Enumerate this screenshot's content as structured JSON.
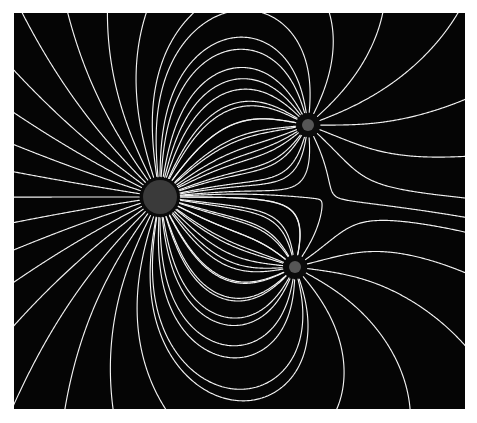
{
  "figure": {
    "canvas_width": 477,
    "canvas_height": 423,
    "background_color": "#ffffff"
  },
  "plot_area": {
    "x": 14,
    "y": 13,
    "width": 451,
    "height": 396,
    "background_color": "#050505",
    "border": "none"
  },
  "style": {
    "line_color": "#f2f2f2",
    "line_width": 1.15,
    "charge_ring_color": "#0b0b0b",
    "charge_core_color_large": "#3a3a3a",
    "charge_core_color_small": "#565656"
  },
  "chart_data": {
    "type": "scatter",
    "subtitle": "",
    "xlabel": "",
    "ylabel": "",
    "xlim": [
      14,
      465
    ],
    "ylim": [
      13,
      409
    ],
    "grid": false,
    "legend": "none",
    "annotations": [
      {
        "name": "saddle-point",
        "x": 322,
        "y": 200,
        "label": "null point between charges"
      }
    ],
    "charges": [
      {
        "name": "large-positive-charge",
        "label": "Q1",
        "x": 160,
        "y": 197,
        "strength": 3.0,
        "sign": "positive",
        "ring_radius": 20,
        "core_radius": 17,
        "core_color": "#3a3a3a",
        "ring_color": "#0b0b0b",
        "field_line_count": 40
      },
      {
        "name": "small-negative-charge-top-right",
        "label": "Q2",
        "x": 308,
        "y": 125,
        "strength": -1.0,
        "sign": "negative",
        "ring_radius": 12,
        "core_radius": 6,
        "core_color": "#565656",
        "ring_color": "#0b0b0b",
        "field_line_count": 24
      },
      {
        "name": "small-negative-charge-bottom",
        "label": "Q3",
        "x": 295,
        "y": 267,
        "strength": -1.0,
        "sign": "negative",
        "ring_radius": 12,
        "core_radius": 6,
        "core_color": "#565656",
        "ring_color": "#0b0b0b",
        "field_line_count": 24
      }
    ],
    "seeds": {
      "large_charge_line_count": 40,
      "top_right_extra_line_count": 17,
      "bottom_extra_line_count": 17,
      "integration_step": 1.1,
      "max_steps": 2600
    }
  }
}
